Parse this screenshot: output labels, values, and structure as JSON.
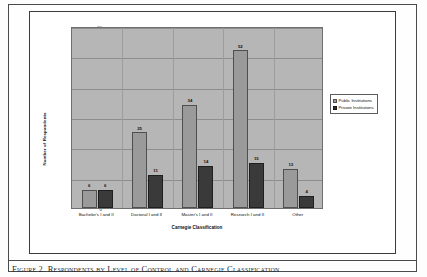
{
  "figure": {
    "caption": "Figure 2. Respondents by Level of Control and Carnegie Classification"
  },
  "legend": {
    "position": "right",
    "items": [
      {
        "label": "Public Institutions",
        "color": "#9a9a9a"
      },
      {
        "label": "Private Institutions",
        "color": "#2e2e2e"
      }
    ]
  },
  "axes": {
    "ylabel": "Number of Respondents",
    "xlabel": "Carnegie Classification",
    "yticks": [
      "60",
      "50",
      "40",
      "30",
      "20",
      "10",
      "0"
    ]
  },
  "chart_data": {
    "type": "bar",
    "title": "",
    "xlabel": "Carnegie Classification",
    "ylabel": "Number of Respondents",
    "ylim": [
      0,
      60
    ],
    "ytick_step": 10,
    "grid": true,
    "legend_position": "right",
    "categories": [
      "Bachelor's I and II",
      "Doctoral I and II",
      "Master's I and II",
      "Research I and II",
      "Other"
    ],
    "series": [
      {
        "name": "Public Institutions",
        "color": "#9a9a9a",
        "values": [
          6,
          25,
          34,
          52,
          13
        ]
      },
      {
        "name": "Private Institutions",
        "color": "#2e2e2e",
        "values": [
          6,
          11,
          14,
          15,
          4
        ]
      }
    ],
    "data_labels": [
      [
        "6",
        "6"
      ],
      [
        "25",
        "11"
      ],
      [
        "34",
        "14"
      ],
      [
        "52",
        "15"
      ],
      [
        "13",
        "4"
      ]
    ]
  }
}
